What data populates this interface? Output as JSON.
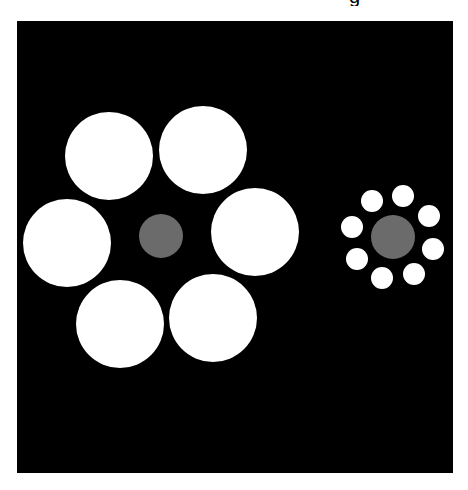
{
  "figure": {
    "name": "Ebbinghaus illusion",
    "caption_fragment": "g",
    "background_color": "#000000",
    "page_color": "#ffffff",
    "panel": {
      "x": 17,
      "y": 21,
      "width": 436,
      "height": 452
    }
  },
  "colors": {
    "surround": "#ffffff",
    "target": "#6b6b6b"
  },
  "left_cluster": {
    "target": {
      "cx": 161,
      "cy": 236,
      "r": 22
    },
    "surrounding_circles": [
      {
        "cx": 109,
        "cy": 156,
        "r": 44
      },
      {
        "cx": 203,
        "cy": 150,
        "r": 44
      },
      {
        "cx": 255,
        "cy": 232,
        "r": 44
      },
      {
        "cx": 213,
        "cy": 318,
        "r": 44
      },
      {
        "cx": 120,
        "cy": 324,
        "r": 44
      },
      {
        "cx": 67,
        "cy": 243,
        "r": 44
      }
    ]
  },
  "right_cluster": {
    "target": {
      "cx": 393,
      "cy": 237,
      "r": 22
    },
    "surrounding_circles": [
      {
        "cx": 372,
        "cy": 201,
        "r": 11
      },
      {
        "cx": 403,
        "cy": 196,
        "r": 11
      },
      {
        "cx": 429,
        "cy": 216,
        "r": 11
      },
      {
        "cx": 433,
        "cy": 249,
        "r": 11
      },
      {
        "cx": 414,
        "cy": 274,
        "r": 11
      },
      {
        "cx": 382,
        "cy": 278,
        "r": 11
      },
      {
        "cx": 357,
        "cy": 259,
        "r": 11
      },
      {
        "cx": 352,
        "cy": 227,
        "r": 11
      }
    ]
  }
}
